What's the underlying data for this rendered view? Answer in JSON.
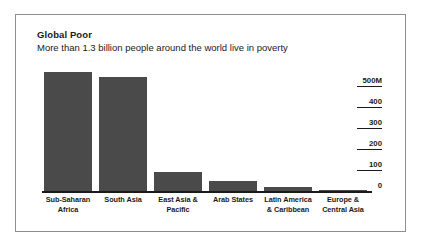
{
  "panel": {
    "title": "Global Poor",
    "subtitle": "More than 1.3 billion people around the world live in poverty"
  },
  "chart_data": {
    "type": "bar",
    "title": "Global Poor",
    "subtitle": "More than 1.3 billion people around the world live in poverty",
    "xlabel": "",
    "ylabel": "",
    "categories": [
      "Sub-Saharan Africa",
      "South Asia",
      "East Asia & Pacific",
      "Arab States",
      "Latin America & Caribbean",
      "Europe & Central Asia"
    ],
    "category_lines": [
      [
        "Sub-Saharan",
        "Africa"
      ],
      [
        "South Asia",
        ""
      ],
      [
        "East Asia &",
        "Pacific"
      ],
      [
        "Arab States",
        ""
      ],
      [
        "Latin America",
        "& Caribbean"
      ],
      [
        "Europe &",
        "Central Asia"
      ]
    ],
    "values": [
      565,
      540,
      90,
      48,
      20,
      2
    ],
    "units": "millions of people",
    "ylim": [
      0,
      565
    ],
    "yticks": [
      0,
      100,
      200,
      300,
      400,
      500
    ],
    "ytick_labels": [
      "0",
      "100",
      "200",
      "300",
      "400",
      "500M"
    ],
    "grid": false,
    "legend": false,
    "axis_position": "right",
    "bar_color": "#4a4a4a",
    "text_color": "#1a1a1a",
    "panel_border_color": "#8e8e8e",
    "background_color": "#ffffff"
  }
}
